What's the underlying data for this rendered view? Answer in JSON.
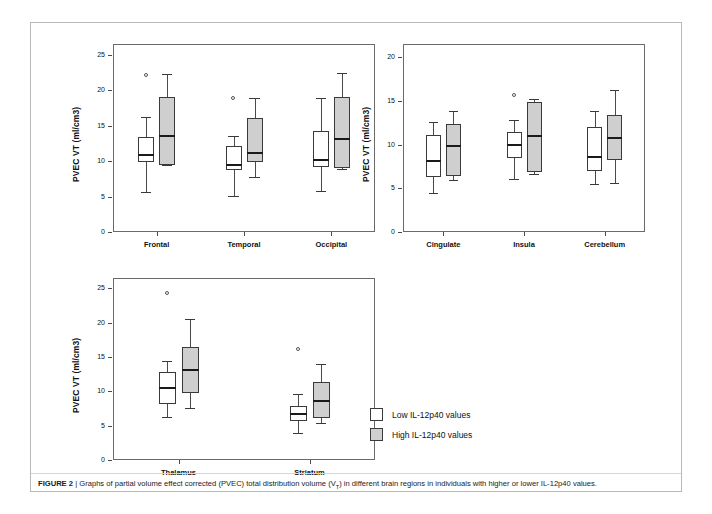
{
  "figure": {
    "label": "FIGURE 2",
    "separator": "|",
    "caption_part1": "Graphs of partial volume effect corrected (PVEC) total distribution volume (V",
    "caption_sub": "T",
    "caption_part2": ") in different brain regions in individuals with higher or lower IL-12p40 values."
  },
  "legend": {
    "position": "bottom-center-right",
    "items": [
      {
        "key": "low",
        "label": "Low IL-12p40 values",
        "color": "#ffffff"
      },
      {
        "key": "high",
        "label": "High IL-12p40 values",
        "color": "#cfcfcf"
      }
    ]
  },
  "chart_data": [
    {
      "type": "box",
      "panel_id": "panel-1",
      "title": "",
      "xlabel": "",
      "ylabel": "PVEC VT (ml/cm3)",
      "ylim": [
        0,
        26.5
      ],
      "yticks": [
        0,
        5,
        10,
        15,
        20,
        25
      ],
      "grid": false,
      "legend_position": "external",
      "categories": [
        "Frontal",
        "Temporal",
        "Occipital"
      ],
      "series": [
        {
          "name": "Low IL-12p40 values",
          "color": "#ffffff",
          "boxes": [
            {
              "category": "Frontal",
              "whisker_low": 5.7,
              "q1": 9.8,
              "median": 10.8,
              "q3": 13.4,
              "whisker_high": 16.2,
              "outliers": [
                22.0
              ]
            },
            {
              "category": "Temporal",
              "whisker_low": 5.1,
              "q1": 8.7,
              "median": 9.4,
              "q3": 12.1,
              "whisker_high": 13.5,
              "outliers": [
                18.8
              ]
            },
            {
              "category": "Occipital",
              "whisker_low": 5.8,
              "q1": 9.1,
              "median": 10.1,
              "q3": 14.3,
              "whisker_high": 18.9,
              "outliers": []
            }
          ]
        },
        {
          "name": "High IL-12p40 values",
          "color": "#cfcfcf",
          "boxes": [
            {
              "category": "Frontal",
              "whisker_low": 9.4,
              "q1": 9.5,
              "median": 13.5,
              "q3": 19.0,
              "whisker_high": 22.3,
              "outliers": []
            },
            {
              "category": "Temporal",
              "whisker_low": 7.8,
              "q1": 9.8,
              "median": 11.2,
              "q3": 16.0,
              "whisker_high": 18.9,
              "outliers": []
            },
            {
              "category": "Occipital",
              "whisker_low": 8.9,
              "q1": 9.0,
              "median": 13.1,
              "q3": 19.0,
              "whisker_high": 22.4,
              "outliers": []
            }
          ]
        }
      ]
    },
    {
      "type": "box",
      "panel_id": "panel-2",
      "title": "",
      "xlabel": "",
      "ylabel": "PVEC VT (ml/cm3)",
      "ylim": [
        0,
        21.5
      ],
      "yticks": [
        0,
        5,
        10,
        15,
        20
      ],
      "grid": false,
      "legend_position": "external",
      "categories": [
        "Cingulate",
        "Insula",
        "Cerebellum"
      ],
      "series": [
        {
          "name": "Low IL-12p40 values",
          "color": "#ffffff",
          "boxes": [
            {
              "category": "Cingulate",
              "whisker_low": 4.5,
              "q1": 6.3,
              "median": 8.1,
              "q3": 11.1,
              "whisker_high": 12.6,
              "outliers": []
            },
            {
              "category": "Insula",
              "whisker_low": 6.1,
              "q1": 8.5,
              "median": 9.9,
              "q3": 11.4,
              "whisker_high": 12.8,
              "outliers": [
                15.6
              ]
            },
            {
              "category": "Cerebellum",
              "whisker_low": 5.5,
              "q1": 7.0,
              "median": 8.6,
              "q3": 12.0,
              "whisker_high": 13.8,
              "outliers": []
            }
          ]
        },
        {
          "name": "High IL-12p40 values",
          "color": "#cfcfcf",
          "boxes": [
            {
              "category": "Cingulate",
              "whisker_low": 5.9,
              "q1": 6.4,
              "median": 9.8,
              "q3": 12.3,
              "whisker_high": 13.8,
              "outliers": []
            },
            {
              "category": "Insula",
              "whisker_low": 6.6,
              "q1": 6.9,
              "median": 11.0,
              "q3": 14.9,
              "whisker_high": 15.2,
              "outliers": []
            },
            {
              "category": "Cerebellum",
              "whisker_low": 5.6,
              "q1": 8.2,
              "median": 10.8,
              "q3": 13.4,
              "whisker_high": 16.2,
              "outliers": []
            }
          ]
        }
      ]
    },
    {
      "type": "box",
      "panel_id": "panel-3",
      "title": "",
      "xlabel": "",
      "ylabel": "PVEC VT (ml/cm3)",
      "ylim": [
        0,
        26.5
      ],
      "yticks": [
        0,
        5,
        10,
        15,
        20,
        25
      ],
      "grid": false,
      "legend_position": "external",
      "categories": [
        "Thalamus",
        "Striatum"
      ],
      "series": [
        {
          "name": "Low IL-12p40 values",
          "color": "#ffffff",
          "boxes": [
            {
              "category": "Thalamus",
              "whisker_low": 6.3,
              "q1": 8.1,
              "median": 10.5,
              "q3": 12.8,
              "whisker_high": 14.4,
              "outliers": [
                24.2
              ]
            },
            {
              "category": "Striatum",
              "whisker_low": 3.9,
              "q1": 5.7,
              "median": 6.7,
              "q3": 7.9,
              "whisker_high": 9.6,
              "outliers": [
                16.1
              ]
            }
          ]
        },
        {
          "name": "High IL-12p40 values",
          "color": "#cfcfcf",
          "boxes": [
            {
              "category": "Thalamus",
              "whisker_low": 7.6,
              "q1": 9.8,
              "median": 13.1,
              "q3": 16.5,
              "whisker_high": 20.6,
              "outliers": []
            },
            {
              "category": "Striatum",
              "whisker_low": 5.4,
              "q1": 6.1,
              "median": 8.6,
              "q3": 11.3,
              "whisker_high": 14.0,
              "outliers": []
            }
          ]
        }
      ]
    }
  ]
}
